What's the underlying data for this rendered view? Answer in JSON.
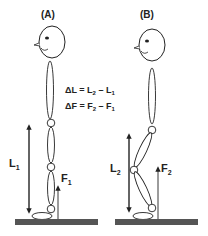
{
  "figure": {
    "panel_a": {
      "label": "(A)",
      "length_label": "L",
      "length_sub": "1",
      "force_label": "F",
      "force_sub": "1"
    },
    "panel_b": {
      "label": "(B)",
      "length_label": "L",
      "length_sub": "2",
      "force_label": "F",
      "force_sub": "2"
    },
    "equations": {
      "delta_l": {
        "lhs": "ΔL = L",
        "s1": "2",
        "mid": " – L",
        "s2": "1"
      },
      "delta_f": {
        "lhs": "ΔF = F",
        "s1": "2",
        "mid": " – F",
        "s2": "1"
      }
    },
    "colors": {
      "line": "#222222",
      "ground": "#555555",
      "background": "#ffffff"
    }
  }
}
